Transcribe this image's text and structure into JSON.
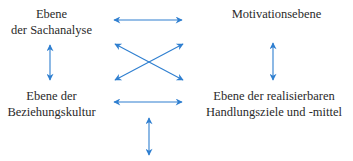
{
  "diagram": {
    "nodes": [
      {
        "id": "sachanalyse",
        "lines": [
          "Ebene",
          "der Sachanalyse"
        ]
      },
      {
        "id": "motivation",
        "lines": [
          "Motivationsebene"
        ]
      },
      {
        "id": "beziehungskultur",
        "lines": [
          "Ebene der",
          "Beziehungskultur"
        ]
      },
      {
        "id": "handlungsziele",
        "lines": [
          "Ebene der realisierbaren",
          "Handlungsziele und -mittel"
        ]
      }
    ],
    "edges": [
      {
        "from": "sachanalyse",
        "to": "motivation",
        "type": "bidirectional"
      },
      {
        "from": "sachanalyse",
        "to": "handlungsziele",
        "type": "bidirectional"
      },
      {
        "from": "beziehungskultur",
        "to": "motivation",
        "type": "bidirectional"
      },
      {
        "from": "beziehungskultur",
        "to": "handlungsziele",
        "type": "bidirectional"
      },
      {
        "from": "sachanalyse",
        "to": "beziehungskultur",
        "type": "bidirectional"
      },
      {
        "from": "motivation",
        "to": "handlungsziele",
        "type": "bidirectional"
      },
      {
        "from": "center-bottom",
        "to": "below",
        "type": "bidirectional"
      }
    ],
    "arrow_color": "#2f7fd0"
  }
}
